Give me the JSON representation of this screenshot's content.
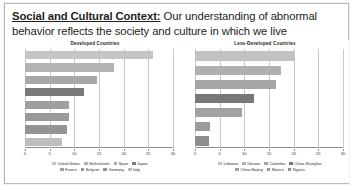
{
  "slide": {
    "title_lead": "Social and Cultural Context:",
    "title_rest": " Our understanding of abnormal behavior reflects the society and culture in which we live",
    "border_color": "#b8b8b8",
    "background_color": "#ffffff"
  },
  "chart_data": [
    {
      "id": "developed",
      "type": "bar",
      "orientation": "horizontal",
      "title": "Developed Countries",
      "xlabel": "",
      "ylabel": "",
      "xlim": [
        0,
        30
      ],
      "ticks": [
        0,
        5,
        10,
        15,
        20,
        25,
        30
      ],
      "grid": true,
      "legend_position": "bottom",
      "categories": [
        "United States",
        "Netherlands",
        "Spain",
        "Japan",
        "France",
        "Belgium",
        "Germany",
        "Italy"
      ],
      "values": [
        26.0,
        18.0,
        14.5,
        12.0,
        9.0,
        9.0,
        8.5,
        7.5
      ],
      "colors": [
        "#c5c5c5",
        "#b3b3b3",
        "#a8a8a8",
        "#7a7a7a",
        "#a0a0a0",
        "#9a9a9a",
        "#949494",
        "#bdbdbd"
      ],
      "legend_rows": [
        [
          "United States",
          "Netherlands",
          "Spain",
          "Japan"
        ],
        [
          "France",
          "Belgium",
          "Germany",
          "Italy"
        ]
      ]
    },
    {
      "id": "less-developed",
      "type": "bar",
      "orientation": "horizontal",
      "title": "Less-Developed Countries",
      "xlabel": "",
      "ylabel": "",
      "xlim": [
        0,
        30
      ],
      "ticks": [
        0,
        5,
        10,
        15,
        20,
        25,
        30
      ],
      "grid": true,
      "legend_position": "bottom",
      "categories": [
        "Lebanon",
        "Ukraine",
        "Colombia",
        "China-Shanghai",
        "China-Beijing",
        "Mexico",
        "Nigeria"
      ],
      "values": [
        20.0,
        17.5,
        16.5,
        12.0,
        9.5,
        3.0,
        2.8
      ],
      "colors": [
        "#c2c2c2",
        "#b0b0b0",
        "#a6a6a6",
        "#787878",
        "#a2a2a2",
        "#9c9c9c",
        "#8e8e8e"
      ],
      "legend_rows": [
        [
          "Lebanon",
          "Ukraine",
          "Colombia",
          "China-Shanghai"
        ],
        [
          "China-Beijing",
          "Mexico",
          "Nigeria"
        ]
      ]
    }
  ]
}
